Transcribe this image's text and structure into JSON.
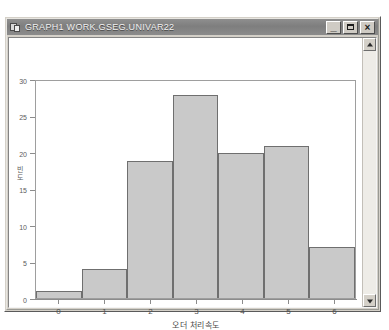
{
  "window": {
    "title": "GRAPH1   WORK.GSEG.UNIVAR22",
    "icon": "graph-window-icon",
    "controls": {
      "minimize": "_",
      "maximize": "□",
      "close": "×"
    }
  },
  "scrollbar": {
    "up_arrow": "scroll-up-arrow",
    "down_arrow": "scroll-down-arrow"
  },
  "chart_data": {
    "type": "bar",
    "title": "",
    "xlabel": "오더 처리속도",
    "ylabel": "빈도",
    "categories": [
      "0",
      "1",
      "2",
      "3",
      "4",
      "5",
      "6"
    ],
    "values": [
      1,
      4,
      19,
      28,
      20,
      21,
      7
    ],
    "x_tick_labels": [
      "0",
      "1",
      "2",
      "3",
      "4",
      "5",
      "6"
    ],
    "y_tick_labels": [
      "0",
      "5",
      "10",
      "15",
      "20",
      "25",
      "30"
    ],
    "y_ticks": [
      0,
      5,
      10,
      15,
      20,
      25,
      30
    ],
    "ylim": [
      0,
      30
    ],
    "grid": false,
    "legend": false,
    "bar_fill": "#c9c9c9",
    "bar_edge": "#6f6f6f",
    "plot_bg": "#ffffff"
  }
}
